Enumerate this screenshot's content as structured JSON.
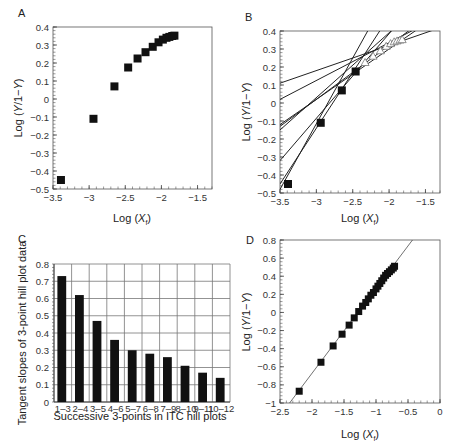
{
  "panels": {
    "A": {
      "label": "A",
      "xlabel": "Log (Xf)",
      "ylabel": "Log (Y/1−Y)"
    },
    "B": {
      "label": "B",
      "xlabel": "Log (Xf)",
      "ylabel": "Log (Y/1−Y)"
    },
    "C": {
      "label": "C",
      "xlabel": "Successive 3-points in ITC hill plots",
      "ylabel": "Tangent slopes of 3-point hill plot data"
    },
    "D": {
      "label": "D",
      "xlabel": "Log (Xf)",
      "ylabel": "Log (Y/1−Y)"
    }
  },
  "chart_data": [
    {
      "panel": "A",
      "type": "scatter",
      "title": "",
      "xlabel": "Log (Xf)",
      "ylabel": "Log (Y/1−Y)",
      "xlim": [
        -3.5,
        -1.3
      ],
      "ylim": [
        -0.5,
        0.4
      ],
      "xticks": [
        -3.5,
        -3,
        -2.5,
        -2,
        -1.5
      ],
      "yticks": [
        -0.5,
        -0.4,
        -0.3,
        -0.2,
        -0.1,
        0,
        0.1,
        0.2,
        0.3,
        0.4
      ],
      "grid": false,
      "series": [
        {
          "name": "ITC hill plot",
          "marker": "square",
          "x": [
            -3.39,
            -2.94,
            -2.65,
            -2.46,
            -2.33,
            -2.22,
            -2.12,
            -2.04,
            -1.98,
            -1.93,
            -1.89,
            -1.85,
            -1.82
          ],
          "y": [
            -0.45,
            -0.11,
            0.07,
            0.175,
            0.225,
            0.26,
            0.29,
            0.315,
            0.33,
            0.34,
            0.345,
            0.35,
            0.352
          ]
        }
      ]
    },
    {
      "panel": "B",
      "type": "scatter",
      "title": "",
      "xlabel": "Log (Xf)",
      "ylabel": "Log (Y/1−Y)",
      "xlim": [
        -3.5,
        -1.3
      ],
      "ylim": [
        -0.5,
        0.4
      ],
      "xticks": [
        -3.5,
        -3,
        -2.5,
        -2,
        -1.5
      ],
      "yticks": [
        -0.5,
        -0.4,
        -0.3,
        -0.2,
        -0.1,
        0,
        0.1,
        0.2,
        0.3,
        0.4
      ],
      "grid": false,
      "series": [
        {
          "name": "filled points",
          "marker": "square",
          "x": [
            -3.39,
            -2.94,
            -2.65,
            -2.46
          ],
          "y": [
            -0.45,
            -0.11,
            0.07,
            0.175
          ]
        },
        {
          "name": "open points",
          "marker": "open",
          "x": [
            -2.33,
            -2.22,
            -2.12,
            -2.04,
            -1.98,
            -1.93,
            -1.89,
            -1.85,
            -1.82
          ],
          "y": [
            0.225,
            0.26,
            0.29,
            0.315,
            0.33,
            0.34,
            0.345,
            0.35,
            0.352
          ]
        }
      ],
      "tangent_lines": [
        {
          "y_at_xmin": -0.48,
          "slope": 0.73
        },
        {
          "y_at_xmin": -0.45,
          "slope": 0.62
        },
        {
          "y_at_xmin": -0.32,
          "slope": 0.47
        },
        {
          "y_at_xmin": -0.15,
          "slope": 0.36
        },
        {
          "y_at_xmin": -0.13,
          "slope": 0.3
        },
        {
          "y_at_xmin": -0.12,
          "slope": 0.28
        },
        {
          "y_at_xmin": 0.02,
          "slope": 0.21
        },
        {
          "y_at_xmin": 0.11,
          "slope": 0.14
        }
      ]
    },
    {
      "panel": "C",
      "type": "bar",
      "title": "",
      "xlabel": "Successive 3-points in ITC hill plots",
      "ylabel": "Tangent slopes of 3-point hill plot data",
      "categories": [
        "1–3",
        "2–4",
        "3–5",
        "4–6",
        "5–7",
        "6–8",
        "7–9",
        "8–10",
        "9–11",
        "10–12"
      ],
      "values": [
        0.73,
        0.62,
        0.47,
        0.36,
        0.3,
        0.28,
        0.26,
        0.21,
        0.17,
        0.14
      ],
      "ylim": [
        0,
        0.8
      ],
      "yticks": [
        0,
        0.1,
        0.2,
        0.3,
        0.4,
        0.5,
        0.6,
        0.7,
        0.8
      ],
      "grid": true
    },
    {
      "panel": "D",
      "type": "scatter",
      "title": "",
      "xlabel": "Log (Xf)",
      "ylabel": "Log (Y/1−Y)",
      "xlim": [
        -2.5,
        0
      ],
      "ylim": [
        -1,
        0.8
      ],
      "xticks": [
        -2.5,
        -2,
        -1.5,
        -1,
        -0.5,
        0
      ],
      "yticks": [
        -1,
        -0.8,
        -0.6,
        -0.4,
        -0.2,
        0,
        0.2,
        0.4,
        0.6,
        0.8
      ],
      "grid": false,
      "series": [
        {
          "name": "data",
          "marker": "square",
          "x": [
            -2.2,
            -1.86,
            -1.67,
            -1.53,
            -1.42,
            -1.34,
            -1.27,
            -1.21,
            -1.16,
            -1.12,
            -1.08,
            -1.04,
            -1.0,
            -0.97,
            -0.94,
            -0.91,
            -0.88,
            -0.85,
            -0.82,
            -0.79,
            -0.76,
            -0.73,
            -0.71
          ],
          "y": [
            -0.87,
            -0.55,
            -0.37,
            -0.24,
            -0.14,
            -0.06,
            0.01,
            0.07,
            0.11,
            0.15,
            0.19,
            0.22,
            0.26,
            0.29,
            0.32,
            0.35,
            0.38,
            0.41,
            0.43,
            0.45,
            0.47,
            0.49,
            0.51
          ]
        }
      ],
      "fit_line": {
        "x": [
          -2.35,
          -0.43
        ],
        "y": [
          -1.0,
          0.8
        ]
      }
    }
  ]
}
